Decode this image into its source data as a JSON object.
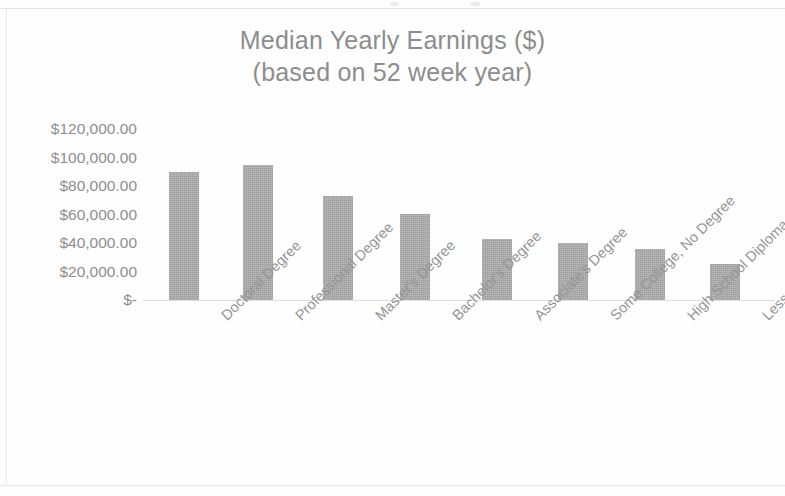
{
  "chart_data": {
    "type": "bar",
    "title": "Median Yearly Earnings ($)",
    "subtitle": "(based on 52 week year)",
    "xlabel": "",
    "ylabel": "",
    "categories": [
      "Doctoral Degree",
      "Professional Degree",
      "Master's Degree",
      "Bachelor's Degree",
      "Associate's Degree",
      "Some College, No Degree",
      "High School Diploma",
      "Less Than High School…"
    ],
    "values": [
      90000,
      95000,
      73000,
      60000,
      43000,
      40000,
      36000,
      25000
    ],
    "ytick_labels": [
      "$120,000.00",
      "$100,000.00",
      "$80,000.00",
      "$60,000.00",
      "$40,000.00",
      "$20,000.00",
      "$-"
    ],
    "ytick_values": [
      120000,
      100000,
      80000,
      60000,
      40000,
      20000,
      0
    ],
    "ylim": [
      0,
      120000
    ],
    "grid": false,
    "legend": false,
    "bar_color": "#a9a9a9",
    "text_color": "#8e8e8e",
    "background_color": "#ffffff"
  }
}
